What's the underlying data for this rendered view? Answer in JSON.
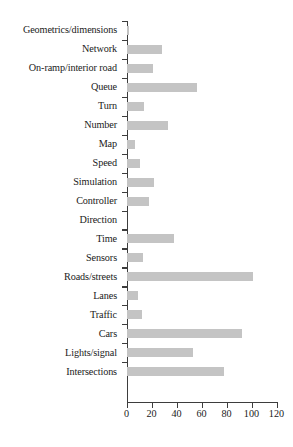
{
  "chart_data": {
    "type": "bar",
    "orientation": "horizontal",
    "title": "",
    "xlabel": "",
    "ylabel": "",
    "xlim": [
      0,
      120
    ],
    "xticks": [
      0,
      20,
      40,
      60,
      80,
      100,
      120
    ],
    "xtick_labels": [
      "0",
      "20",
      "40",
      "60",
      "80",
      "100",
      "120"
    ],
    "grid": false,
    "legend": false,
    "bar_color": "#c4c4c4",
    "axis_color": "#3d3d3d",
    "categories": [
      "Geometrics/dimensions",
      "Network",
      "On-ramp/interior road",
      "Queue",
      "Turn",
      "Number",
      "Map",
      "Speed",
      "Simulation",
      "Controller",
      "Direction",
      "Time",
      "Sensors",
      "Roads/streets",
      "Lanes",
      "Traffic",
      "Cars",
      "Lights/signal",
      "Intersections"
    ],
    "values": [
      2,
      28,
      21,
      56,
      14,
      33,
      7,
      11,
      22,
      18,
      0,
      38,
      13,
      101,
      9,
      12,
      92,
      53,
      78
    ]
  }
}
